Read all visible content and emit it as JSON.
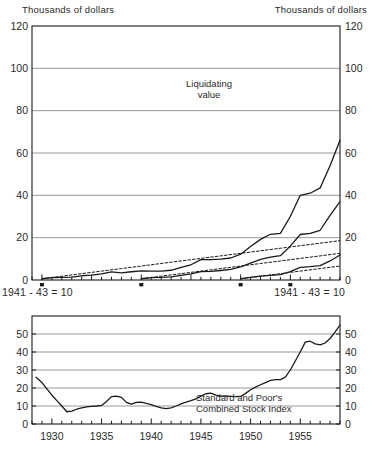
{
  "figure": {
    "top_header_left": "Thousands of dollars",
    "top_header_right": "Thousands of dollars",
    "base_note_left": "1941 - 43 = 10",
    "base_note_right": "1941 - 43 = 10",
    "annotation_liquidating": "Liquidating",
    "annotation_liquidating2": "value",
    "annotation_sp1": "Standard and Poor's",
    "annotation_sp2": "Combined Stock Index",
    "line_color": "#1a1a1a",
    "grid_color": "#8c8c8c",
    "frame_color": "#1a1a1a"
  },
  "chart_data": [
    {
      "type": "line",
      "title": "Liquidating value",
      "xlabel": "",
      "ylabel": "Thousands of dollars",
      "ylim": [
        0,
        120
      ],
      "yticks": [
        0,
        20,
        40,
        60,
        80,
        100,
        120
      ],
      "ytick_labels": [
        "0",
        "20",
        "40",
        "60",
        "80",
        "100",
        "120"
      ],
      "xlim": [
        1928,
        1959
      ],
      "xticks": [
        1929,
        1934,
        1939,
        1944,
        1949,
        1954
      ],
      "xtick_labels": [
        "",
        "",
        "",
        "",
        "",
        ""
      ],
      "grid": true,
      "legend": "none",
      "note": "1941 - 43 = 10",
      "series": [
        {
          "name": "Liquidating value - program begun 1929",
          "style": "solid",
          "x": [
            1929,
            1930,
            1931,
            1932,
            1933,
            1934,
            1935,
            1936,
            1937,
            1938,
            1939,
            1940,
            1941,
            1942,
            1943,
            1944,
            1945,
            1946,
            1947,
            1948,
            1949,
            1950,
            1951,
            1952,
            1953,
            1954,
            1955,
            1956,
            1957,
            1958,
            1959
          ],
          "y": [
            0.6,
            1.1,
            1.2,
            1.4,
            2.0,
            2.3,
            2.9,
            3.8,
            3.4,
            3.9,
            4.3,
            4.2,
            4.2,
            4.6,
            6.0,
            7.2,
            9.6,
            9.6,
            9.9,
            10.4,
            12.2,
            15.8,
            19.2,
            21.6,
            22.0,
            30.0,
            40.0,
            41.0,
            43.5,
            54.0,
            66.0
          ]
        },
        {
          "name": "Cumulative payments - program begun 1929",
          "style": "dotted",
          "x": [
            1929,
            1931,
            1933,
            1935,
            1937,
            1939,
            1941,
            1943,
            1945,
            1947,
            1949,
            1951,
            1953,
            1955,
            1957,
            1959
          ],
          "y": [
            0.6,
            1.8,
            3.0,
            4.2,
            5.4,
            6.6,
            7.8,
            9.0,
            10.2,
            11.4,
            12.6,
            13.8,
            15.0,
            16.2,
            17.4,
            18.6
          ]
        },
        {
          "name": "Liquidating value - program begun 1939",
          "style": "solid",
          "x": [
            1939,
            1940,
            1941,
            1942,
            1943,
            1944,
            1945,
            1946,
            1947,
            1948,
            1949,
            1950,
            1951,
            1952,
            1953,
            1954,
            1955,
            1956,
            1957,
            1958,
            1959
          ],
          "y": [
            0.6,
            1.1,
            1.2,
            1.5,
            2.2,
            2.9,
            4.0,
            4.1,
            4.5,
            5.0,
            6.2,
            8.0,
            9.7,
            10.8,
            11.5,
            16.0,
            21.5,
            22.0,
            23.5,
            30.5,
            37.0
          ]
        },
        {
          "name": "Cumulative payments - program begun 1939",
          "style": "dotted",
          "x": [
            1939,
            1941,
            1943,
            1945,
            1947,
            1949,
            1951,
            1953,
            1955,
            1957,
            1959
          ],
          "y": [
            0.6,
            1.8,
            3.0,
            4.2,
            5.4,
            6.6,
            7.8,
            9.0,
            10.2,
            11.4,
            12.6
          ]
        },
        {
          "name": "Liquidating value - program begun 1949",
          "style": "solid",
          "x": [
            1949,
            1950,
            1951,
            1952,
            1953,
            1954,
            1955,
            1956,
            1957,
            1958,
            1959
          ],
          "y": [
            0.6,
            1.2,
            1.8,
            2.2,
            2.5,
            4.0,
            6.0,
            6.3,
            6.8,
            9.0,
            11.8
          ]
        },
        {
          "name": "Cumulative payments - program begun 1949",
          "style": "dotted",
          "x": [
            1949,
            1951,
            1953,
            1955,
            1957,
            1959
          ],
          "y": [
            0.6,
            1.8,
            3.0,
            4.2,
            5.4,
            6.6
          ]
        }
      ],
      "start_markers": [
        1929,
        1939,
        1949,
        1954
      ]
    },
    {
      "type": "line",
      "title": "Standard and Poor's Combined Stock Index",
      "xlabel": "",
      "ylabel": "",
      "ylim": [
        0,
        60
      ],
      "yticks": [
        0,
        10,
        20,
        30,
        40,
        50
      ],
      "ytick_labels": [
        "0",
        "10",
        "20",
        "30",
        "40",
        "50"
      ],
      "xlim": [
        1928,
        1959
      ],
      "xticks": [
        1930,
        1935,
        1940,
        1945,
        1950,
        1955
      ],
      "xtick_labels": [
        "1930",
        "1935",
        "1940",
        "1945",
        "1950",
        "1955"
      ],
      "grid": true,
      "legend": "none",
      "series": [
        {
          "name": "Standard and Poor's Combined Stock Index",
          "style": "solid",
          "x": [
            1928.4,
            1929,
            1929.5,
            1930,
            1930.5,
            1931,
            1931.5,
            1932,
            1932.5,
            1933,
            1933.5,
            1934,
            1934.5,
            1935,
            1935.5,
            1936,
            1936.5,
            1937,
            1937.5,
            1938,
            1938.5,
            1939,
            1939.5,
            1940,
            1940.5,
            1941,
            1941.5,
            1942,
            1942.5,
            1943,
            1943.5,
            1944,
            1944.5,
            1945,
            1945.5,
            1946,
            1946.5,
            1947,
            1947.5,
            1948,
            1948.5,
            1949,
            1949.5,
            1950,
            1950.5,
            1951,
            1951.5,
            1952,
            1952.5,
            1953,
            1953.5,
            1954,
            1954.5,
            1955,
            1955.5,
            1956,
            1956.5,
            1957,
            1957.5,
            1958,
            1958.5,
            1959
          ],
          "y": [
            26.0,
            23.0,
            19.5,
            16.0,
            13.0,
            10.0,
            6.8,
            7.2,
            8.2,
            9.0,
            9.5,
            9.8,
            10.0,
            10.3,
            12.5,
            15.2,
            15.5,
            14.8,
            12.0,
            11.0,
            12.0,
            12.2,
            11.5,
            10.8,
            9.8,
            9.0,
            8.6,
            9.0,
            10.0,
            11.2,
            12.2,
            13.0,
            14.0,
            15.5,
            16.8,
            17.2,
            16.0,
            15.5,
            15.6,
            15.4,
            15.2,
            15.3,
            17.0,
            19.0,
            20.5,
            21.8,
            23.0,
            24.2,
            24.6,
            24.7,
            26.0,
            30.0,
            35.0,
            40.0,
            45.5,
            46.0,
            44.5,
            44.0,
            45.0,
            47.5,
            51.0,
            55.0
          ]
        }
      ]
    }
  ]
}
